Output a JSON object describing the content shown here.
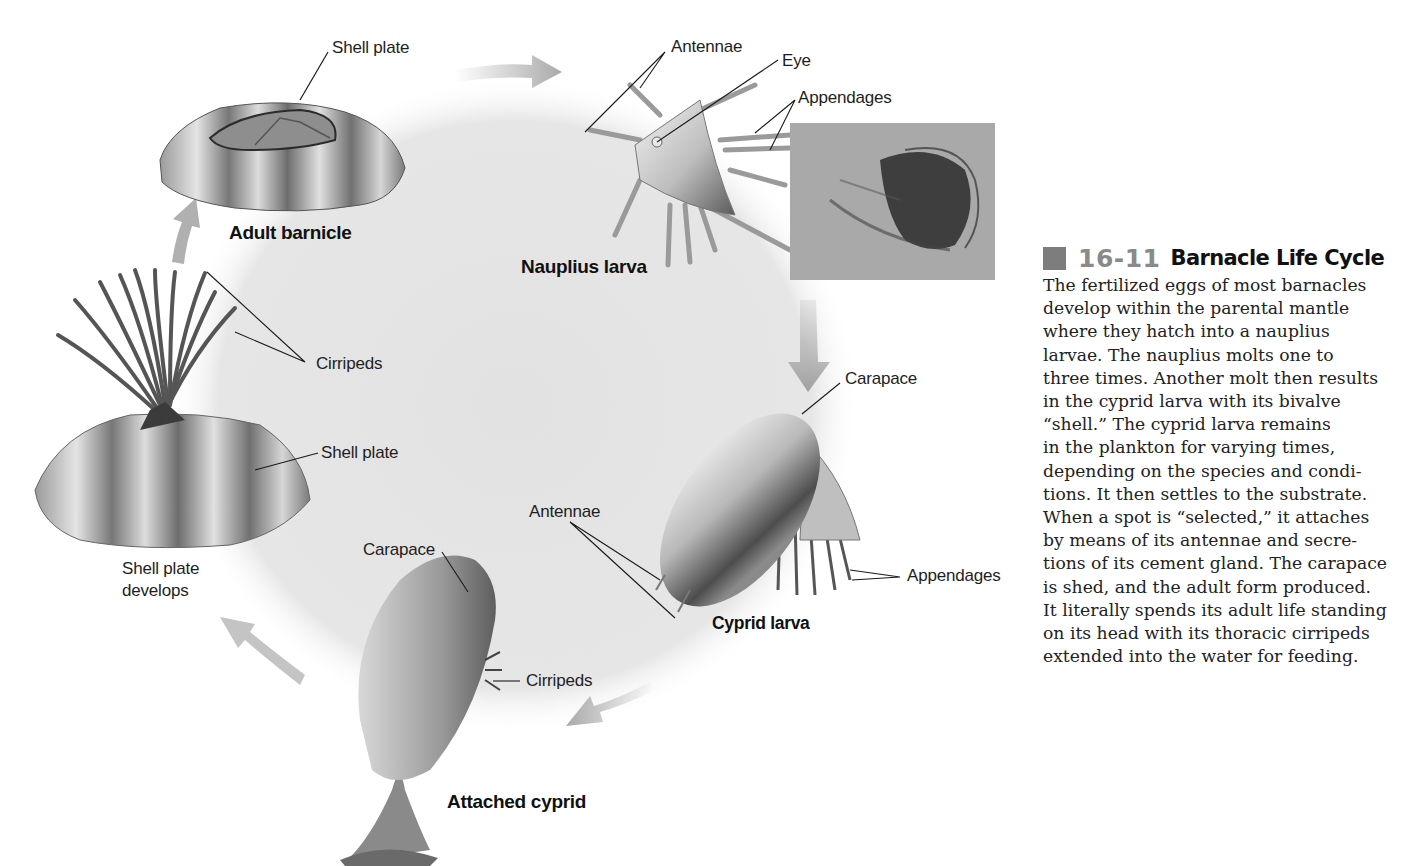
{
  "figure": {
    "number": "16-11",
    "title": "Barnacle Life Cycle",
    "caption_lines": [
      "The fertilized eggs of most barnacles",
      "develop within the parental mantle",
      "where they hatch into a nauplius",
      "larvae. The nauplius molts one to",
      "three times. Another molt then results",
      "in the cyprid larva with its bivalve",
      "“shell.” The cyprid larva remains",
      "in the plankton for varying times,",
      "depending on the species and condi-",
      "tions. It then settles to the substrate.",
      "When a spot is “selected,” it attaches",
      "by means of its antennae and secre-",
      "tions of its cement gland. The carapace",
      "is shed, and the adult form produced.",
      "It literally spends its adult life standing",
      "on its head with its thoracic cirripeds",
      "extended into the water for feeding."
    ],
    "colors": {
      "cycle_background": "#e6e6e6",
      "arrow": "#a9a9a9",
      "number": "#8a8a8a",
      "square": "#7d7d7d",
      "leader_line": "#1a1a1a"
    }
  },
  "stages": {
    "adult_barnacle": {
      "title": "Adult barnicle",
      "labels": {
        "shell_plate": "Shell plate"
      }
    },
    "nauplius_larva": {
      "title": "Nauplius larva",
      "labels": {
        "antennae": "Antennae",
        "eye": "Eye",
        "appendages": "Appendages"
      }
    },
    "cyprid_larva": {
      "title": "Cyprid larva",
      "labels": {
        "carapace": "Carapace",
        "antennae": "Antennae",
        "appendages": "Appendages"
      }
    },
    "attached_cyprid": {
      "title": "Attached cyprid",
      "labels": {
        "carapace": "Carapace",
        "cirripeds": "Cirripeds"
      }
    },
    "shell_plate_develops": {
      "title": "Shell plate\ndevelops",
      "labels": {
        "cirripeds": "Cirripeds",
        "shell_plate": "Shell plate"
      }
    }
  },
  "photo": {
    "subject": "nauplius-larva-micrograph"
  }
}
